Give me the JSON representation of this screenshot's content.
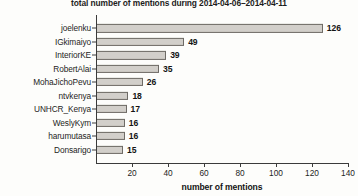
{
  "chart_data": {
    "type": "bar",
    "orientation": "horizontal",
    "title": "total number of mentions during 2014-04-06–2014-04-11",
    "xlabel": "number of mentions",
    "ylabel": "",
    "xlim": [
      0,
      140
    ],
    "xticks": [
      0,
      20,
      40,
      60,
      80,
      100,
      120,
      140
    ],
    "xtick_labels": [
      "",
      "20",
      "40",
      "60",
      "80",
      "100",
      "120",
      "140"
    ],
    "grid": false,
    "legend": false,
    "bar_color": "#d2cfca",
    "bar_edge_color": "#6e6b66",
    "categories": [
      "joelenku",
      "IGkimaiyo",
      "InteriorKE",
      "RobertAlai",
      "MohaJichoPevu",
      "ntvkenya",
      "UNHCR_Kenya",
      "WeslyKym",
      "harumutasa",
      "Donsarigo"
    ],
    "values": [
      126,
      49,
      39,
      35,
      26,
      18,
      17,
      16,
      16,
      15
    ],
    "value_labels": [
      "126",
      "49",
      "39",
      "35",
      "26",
      "18",
      "17",
      "16",
      "16",
      "15"
    ]
  }
}
